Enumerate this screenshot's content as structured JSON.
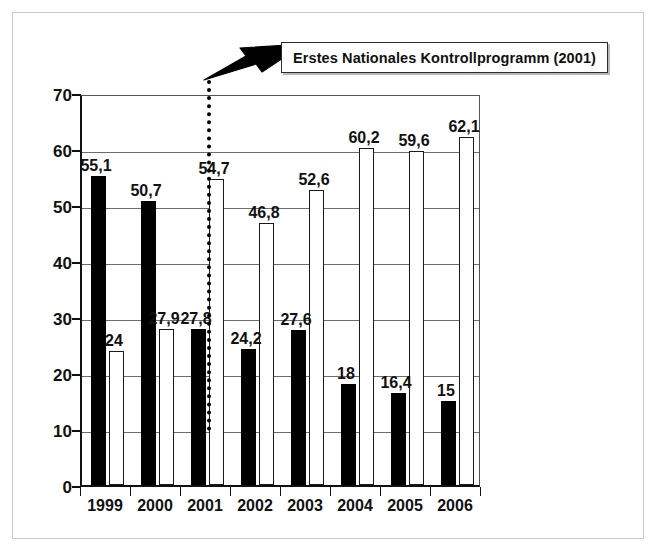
{
  "chart_data": {
    "type": "bar",
    "title": "",
    "xlabel": "",
    "ylabel": "",
    "categories": [
      "1999",
      "2000",
      "2001",
      "2002",
      "2003",
      "2004",
      "2005",
      "2006"
    ],
    "series": [
      {
        "name": "black-bars",
        "color": "#000000",
        "values": [
          55.1,
          50.7,
          27.8,
          24.2,
          27.6,
          18,
          16.4,
          15
        ],
        "labels": [
          "55,1",
          "50,7",
          "27,8",
          "24,2",
          "27,6",
          "18",
          "16,4",
          "15"
        ]
      },
      {
        "name": "white-bars",
        "color": "#ffffff",
        "values": [
          24,
          27.9,
          54.7,
          46.8,
          52.6,
          60.2,
          59.6,
          62.1
        ],
        "labels": [
          "24",
          "27,9",
          "54,7",
          "46,8",
          "52,6",
          "60,2",
          "59,6",
          "62,1"
        ]
      }
    ],
    "ylim": [
      0,
      70
    ],
    "ytick_values": [
      0,
      10,
      20,
      30,
      40,
      50,
      60,
      70
    ],
    "ytick_labels": [
      "0",
      "10",
      "20",
      "30",
      "40",
      "50",
      "60",
      "70"
    ],
    "grid": true,
    "legend": "none",
    "annotations": [
      {
        "name": "first-national-control-programme",
        "text": "Erstes Nationales Kontrollprogramm (2001)",
        "marker_type": "dotted-vertical-line",
        "marker_category": "2001"
      }
    ]
  },
  "colors": {
    "dark_bar": "#000000",
    "light_bar": "#ffffff",
    "bar_outline": "#1a1a1a",
    "gridline": "#6d6d6d",
    "axis": "#111111",
    "frame": "#c9c9c9",
    "callout_border": "#2b2b2b"
  }
}
